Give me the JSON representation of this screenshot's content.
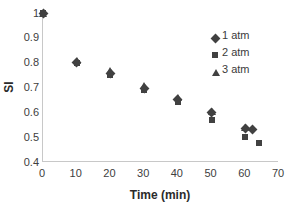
{
  "chart_data": {
    "type": "scatter",
    "title": "",
    "xlabel": "Time (min)",
    "ylabel": "SI",
    "xlim": [
      0,
      70
    ],
    "ylim": [
      0.4,
      1
    ],
    "xticks": [
      0,
      10,
      20,
      30,
      40,
      50,
      60,
      70
    ],
    "yticks": [
      "0.4",
      "0.5",
      "0.6",
      "0.7",
      "0.8",
      "0.9",
      "1"
    ],
    "grid": false,
    "legend_position": "top-right",
    "marker_color": "#414141",
    "axis_color": "#c8c8c8",
    "series": [
      {
        "name": "1 atm",
        "marker": "diamond",
        "points": [
          {
            "x": 0,
            "y": 1.0
          },
          {
            "x": 10,
            "y": 0.8
          },
          {
            "x": 20,
            "y": 0.755
          },
          {
            "x": 30,
            "y": 0.695
          },
          {
            "x": 40,
            "y": 0.65
          },
          {
            "x": 50,
            "y": 0.6
          },
          {
            "x": 60,
            "y": 0.535
          },
          {
            "x": 62,
            "y": 0.53
          }
        ]
      },
      {
        "name": "2 atm",
        "marker": "square",
        "points": [
          {
            "x": 0,
            "y": 1.0
          },
          {
            "x": 10,
            "y": 0.8
          },
          {
            "x": 20,
            "y": 0.75
          },
          {
            "x": 30,
            "y": 0.69
          },
          {
            "x": 40,
            "y": 0.64
          },
          {
            "x": 50,
            "y": 0.57
          },
          {
            "x": 60,
            "y": 0.5
          },
          {
            "x": 64,
            "y": 0.475
          }
        ]
      },
      {
        "name": "3 atm",
        "marker": "triangle",
        "points": [
          {
            "x": 0,
            "y": 1.0
          },
          {
            "x": 10,
            "y": 0.81
          },
          {
            "x": 20,
            "y": 0.77
          },
          {
            "x": 30,
            "y": 0.71
          },
          {
            "x": 40,
            "y": 0.66
          },
          {
            "x": 50,
            "y": 0.605
          },
          {
            "x": 60,
            "y": 0.54
          }
        ]
      }
    ]
  }
}
